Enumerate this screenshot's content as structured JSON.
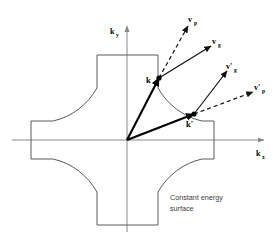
{
  "figure": {
    "caption_line1": "Constant energy",
    "caption_line2": "surface",
    "background_color": "#ffffff"
  },
  "axes": {
    "x_label": "k",
    "x_sub": "x",
    "y_label": "k",
    "y_sub": "y",
    "axis_color": "#8a8a8a",
    "origin": {
      "x": 127,
      "y": 140
    }
  },
  "contour": {
    "name": "constant-energy-surface",
    "shape": "cross-with-concave-arcs",
    "stroke_color": "#5a5a5a",
    "top_edge_y": 55,
    "bottom_edge_y": 225,
    "left_edge_x": 31,
    "right_edge_x": 214
  },
  "points": [
    {
      "id": "k",
      "label": "k",
      "x": 159,
      "y": 78
    },
    {
      "id": "k-prime",
      "label": "k'",
      "x": 194,
      "y": 114
    }
  ],
  "vectors": [
    {
      "id": "k-vector",
      "label": "k",
      "style": "solid-thick",
      "from": {
        "x": 127,
        "y": 140
      },
      "to": {
        "x": 159,
        "y": 78
      }
    },
    {
      "id": "k-prime-vector",
      "label": "k'",
      "style": "solid-thick",
      "from": {
        "x": 127,
        "y": 140
      },
      "to": {
        "x": 194,
        "y": 114
      }
    },
    {
      "id": "vp",
      "label": "v",
      "sub": "p",
      "style": "dashed",
      "from": {
        "x": 159,
        "y": 78
      },
      "to": {
        "x": 188,
        "y": 26
      }
    },
    {
      "id": "vg",
      "label": "v",
      "sub": "g",
      "style": "solid",
      "from": {
        "x": 159,
        "y": 78
      },
      "to": {
        "x": 211,
        "y": 46
      }
    },
    {
      "id": "vg-prime",
      "label": "v'",
      "sub": "g",
      "style": "solid",
      "from": {
        "x": 194,
        "y": 114
      },
      "to": {
        "x": 227,
        "y": 71
      }
    },
    {
      "id": "vp-prime",
      "label": "v'",
      "sub": "p",
      "style": "dashed",
      "from": {
        "x": 194,
        "y": 114
      },
      "to": {
        "x": 253,
        "y": 92
      }
    }
  ],
  "labels": {
    "vp": {
      "text": "v",
      "sub": "p"
    },
    "vg": {
      "text": "v",
      "sub": "g"
    },
    "vp_prime": {
      "text": "v'",
      "sub": "p"
    },
    "vg_prime": {
      "text": "v'",
      "sub": "g"
    },
    "k": "k",
    "k_prime": "k'"
  }
}
